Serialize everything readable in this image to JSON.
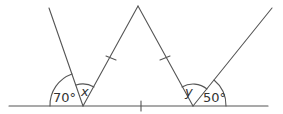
{
  "diagram": {
    "type": "geometry-angles",
    "stroke_color": "#555555",
    "labels": {
      "angle_left_given": "70°",
      "angle_left_unknown": "x",
      "angle_right_unknown": "y",
      "angle_right_given": "50°"
    },
    "points": {
      "baseline_start": [
        9,
        106
      ],
      "baseline_end": [
        268,
        106
      ],
      "left_vertex": [
        83,
        106
      ],
      "right_vertex": [
        193,
        106
      ],
      "apex": [
        138,
        6
      ],
      "left_outer_top": [
        49,
        8
      ],
      "right_outer_top": [
        272,
        8
      ]
    },
    "tick_marks": [
      "triangle left side",
      "triangle right side",
      "baseline midpoint between vertices"
    ]
  }
}
